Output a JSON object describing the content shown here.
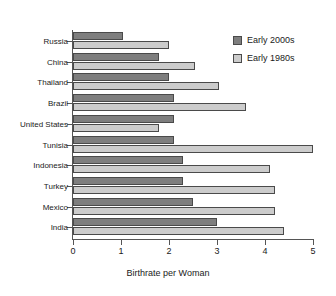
{
  "chart_data": {
    "type": "bar",
    "orientation": "horizontal",
    "title": "",
    "xlabel": "Birthrate per Woman",
    "ylabel": "",
    "xlim": [
      0,
      5
    ],
    "xticks": [
      0,
      1,
      2,
      3,
      4,
      5
    ],
    "grid": false,
    "legend_position": "top-right",
    "categories": [
      "Russia",
      "China",
      "Thailand",
      "Brazil",
      "United States",
      "Tunisia",
      "Indonesia",
      "Turkey",
      "Mexico",
      "India"
    ],
    "series": [
      {
        "name": "Early 2000s",
        "color": "#7e7e7e",
        "values": [
          1.05,
          1.8,
          2.0,
          2.1,
          2.1,
          2.1,
          2.3,
          2.3,
          2.5,
          3.0
        ]
      },
      {
        "name": "Early 1980s",
        "color": "#cccccc",
        "values": [
          2.0,
          2.55,
          3.05,
          3.6,
          1.8,
          5.0,
          4.1,
          4.2,
          4.2,
          4.4
        ]
      }
    ]
  },
  "legend": {
    "items": [
      {
        "label": "Early 2000s",
        "swatch": "recent"
      },
      {
        "label": "Early 1980s",
        "swatch": "older"
      }
    ]
  }
}
